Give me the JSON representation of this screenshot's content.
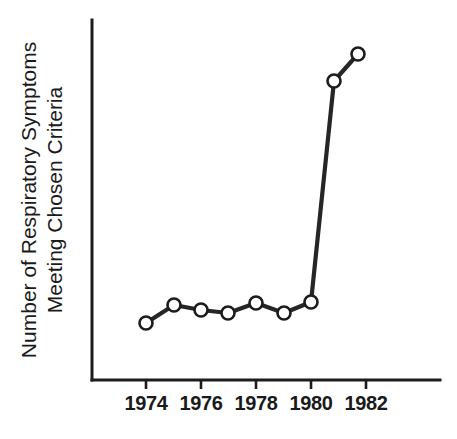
{
  "chart_data": {
    "type": "line",
    "title": "",
    "subtitle": "",
    "xlabel": "",
    "ylabel": "Number of Respiratory Symptoms Meeting Chosen Criteria",
    "ylabel_lines": [
      "Number of Respiratory Symptoms",
      "Meeting Chosen Criteria"
    ],
    "x": [
      1974,
      1975,
      1976,
      1977,
      1978,
      1979,
      1980,
      1981,
      1982
    ],
    "values": [
      2.1,
      3.0,
      2.75,
      2.6,
      3.1,
      2.6,
      3.2,
      14.0,
      15.4
    ],
    "series": [
      {
        "name": "Respiratory symptoms meeting chosen criteria",
        "values": [
          2.1,
          3.0,
          2.75,
          2.6,
          3.1,
          2.6,
          3.2,
          14.0,
          15.4
        ]
      }
    ],
    "xtick_values": [
      1974,
      1976,
      1978,
      1980,
      1982
    ],
    "xtick_labels": [
      "1974",
      "1976",
      "1978",
      "1980",
      "1982"
    ],
    "ytick_labels": [],
    "xlim": [
      1973.0,
      1985.7
    ],
    "ylim": [
      0,
      17.4
    ],
    "grid": false,
    "legend": false,
    "legend_position": "none",
    "annotations": [],
    "marker": "open-circle",
    "line_color": "#262626",
    "marker_face_color": "#ffffff",
    "marker_edge_color": "#1c1c1c",
    "axis_color": "#1c1c1c",
    "background_color": "#ffffff"
  },
  "figure": {
    "geometry": {
      "axis_x": 92,
      "axis_y_top": 20,
      "axis_y_bottom": 380,
      "axis_x_right": 440,
      "tick_length": 9,
      "px_per_year": 27.5,
      "x_origin_px": 146,
      "x_origin_year": 1974,
      "marker_radius": 6.5
    },
    "points_px": [
      {
        "year": "1974",
        "cx": 146,
        "cy": 323
      },
      {
        "year": "1975",
        "cx": 174,
        "cy": 305
      },
      {
        "year": "1976",
        "cx": 201,
        "cy": 310
      },
      {
        "year": "1977",
        "cx": 228,
        "cy": 313
      },
      {
        "year": "1978",
        "cx": 256,
        "cy": 303
      },
      {
        "year": "1979",
        "cx": 284,
        "cy": 313
      },
      {
        "year": "1980",
        "cx": 311,
        "cy": 302
      },
      {
        "year": "1981",
        "cx": 334,
        "cy": 81
      },
      {
        "year": "1982",
        "cx": 358,
        "cy": 54
      }
    ],
    "ticks_px": [
      {
        "label": "1974",
        "x": 146
      },
      {
        "label": "1976",
        "x": 201
      },
      {
        "label": "1978",
        "x": 256
      },
      {
        "label": "1980",
        "x": 311
      },
      {
        "label": "1982",
        "x": 366
      }
    ],
    "tick_label_y": 410,
    "ylabel_line1_x": 36,
    "ylabel_line2_x": 62,
    "ylabel_center_y": 200
  }
}
